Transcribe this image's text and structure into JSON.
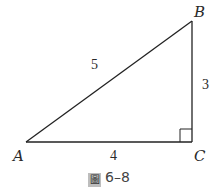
{
  "figure": {
    "caption_prefix": "圖",
    "caption_number": "6–8"
  },
  "triangle": {
    "vertices": {
      "A": {
        "label": "A",
        "x": 26,
        "y": 142
      },
      "B": {
        "label": "B",
        "x": 192,
        "y": 21
      },
      "C": {
        "label": "C",
        "x": 192,
        "y": 142
      }
    },
    "sides": {
      "AB": {
        "label": "5"
      },
      "BC": {
        "label": "3"
      },
      "AC": {
        "label": "4"
      }
    },
    "right_angle_at": "C",
    "line_color": "#222222"
  }
}
